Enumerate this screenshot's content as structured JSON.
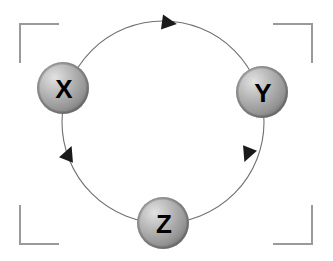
{
  "diagram": {
    "canvas": {
      "width": 333,
      "height": 261,
      "background": "#ffffff"
    },
    "cycle_path": {
      "shape": "circle",
      "center_x": 163,
      "center_y": 122,
      "radius": 101,
      "stroke_color": "#6e6e6e",
      "stroke_width": 1,
      "direction": "clockwise"
    },
    "nodes": [
      {
        "id": "node-x",
        "label": "X",
        "cx": 63,
        "cy": 88,
        "r": 26,
        "fill_light": "#d8d8d8",
        "fill_mid": "#a8a8a8",
        "fill_dark": "#8a8a8a",
        "label_color": "#111111"
      },
      {
        "id": "node-y",
        "label": "Y",
        "cx": 262,
        "cy": 92,
        "r": 26,
        "fill_light": "#d8d8d8",
        "fill_mid": "#a8a8a8",
        "fill_dark": "#8a8a8a",
        "label_color": "#111111"
      },
      {
        "id": "node-z",
        "label": "Z",
        "cx": 163,
        "cy": 223,
        "r": 26,
        "fill_light": "#d8d8d8",
        "fill_mid": "#a8a8a8",
        "fill_dark": "#8a8a8a",
        "label_color": "#111111"
      }
    ],
    "arrowheads": [
      {
        "id": "arrow-x-to-y",
        "from": "X",
        "to": "Y",
        "x": 162,
        "y": 22,
        "angle": 8,
        "size": 13,
        "color": "#1a1a1a"
      },
      {
        "id": "arrow-y-to-z",
        "from": "Y",
        "to": "Z",
        "x": 254,
        "y": 152,
        "angle": 112,
        "size": 13,
        "color": "#1a1a1a"
      },
      {
        "id": "arrow-z-to-x",
        "from": "Z",
        "to": "X",
        "x": 70,
        "y": 156,
        "angle": -68,
        "size": 13,
        "color": "#1a1a1a"
      }
    ],
    "corner_brackets": {
      "stroke_color": "#9a9a9a",
      "stroke_width": 2,
      "arm_length": 38,
      "left": 20,
      "top": 24,
      "right": 312,
      "bottom": 244,
      "corners": [
        {
          "id": "bracket-top-left",
          "position": "top-left"
        },
        {
          "id": "bracket-top-right",
          "position": "top-right"
        },
        {
          "id": "bracket-bottom-left",
          "position": "bottom-left"
        },
        {
          "id": "bracket-bottom-right",
          "position": "bottom-right"
        }
      ]
    }
  }
}
